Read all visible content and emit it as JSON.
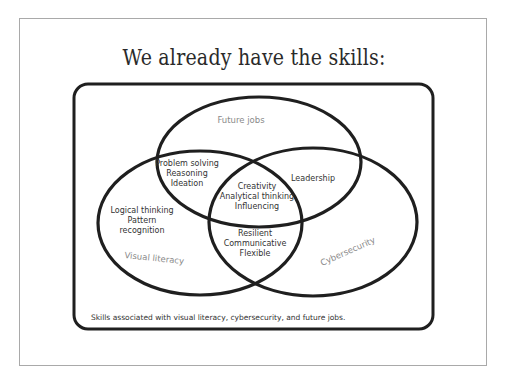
{
  "slide": {
    "title": "We already have the skills:",
    "caption": "Skills associated with visual literacy, cybersecurity, and future jobs.",
    "colors": {
      "outline": "#1f1f1f",
      "frame": "#a9a9a9",
      "set_label": "#8a8a8a",
      "text": "#333333"
    }
  },
  "venn": {
    "sets": [
      {
        "id": "future_jobs",
        "label": "Future jobs"
      },
      {
        "id": "visual_literacy",
        "label": "Visual literacy"
      },
      {
        "id": "cybersecurity",
        "label": "Cybersecurity"
      }
    ],
    "regions": {
      "future_visual": [
        "Problem solving",
        "Reasoning",
        "Ideation"
      ],
      "future_cyber": [
        "Leadership"
      ],
      "all_three": [
        "Creativity",
        "Analytical thinking",
        "Influencing"
      ],
      "visual_only": [
        "Logical thinking",
        "Pattern",
        "recognition"
      ],
      "visual_cyber": [
        "Resilient",
        "Communicative",
        "Flexible"
      ]
    }
  }
}
